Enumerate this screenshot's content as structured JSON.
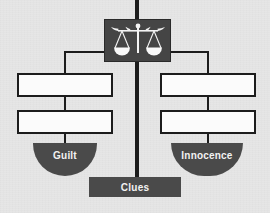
{
  "diagram": {
    "type": "hierarchy",
    "title": "",
    "root": {
      "icon": "scales-of-justice-icon",
      "label": ""
    },
    "branches": [
      {
        "side": "left",
        "boxes": [
          {
            "label": ""
          },
          {
            "label": ""
          }
        ],
        "outcome": {
          "label": "Guilt",
          "shape": "semicircle-pan"
        }
      },
      {
        "side": "right",
        "boxes": [
          {
            "label": ""
          },
          {
            "label": ""
          }
        ],
        "outcome": {
          "label": "Innocence",
          "shape": "semicircle-pan"
        }
      }
    ],
    "base": {
      "label": "Clues",
      "shape": "rectangle"
    },
    "colors": {
      "background": "#e6e6e6",
      "line": "#1c1c1c",
      "emblem_fill": "#454545",
      "pan_fill": "#4a4a4a",
      "box_fill": "#fbfbfb",
      "box_border": "#1c1c1c",
      "label_text": "#f2f2f2"
    }
  }
}
